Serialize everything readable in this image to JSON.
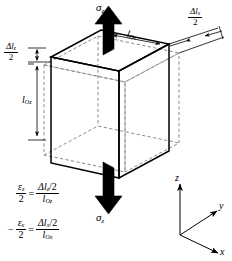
{
  "figure": {
    "background_color": "#ffffff",
    "line_color": "#000000",
    "dashed_color": "#8c8c8c"
  },
  "stress_labels": {
    "top": {
      "symbol": "σ",
      "subscript": "z"
    },
    "bottom": {
      "symbol": "σ",
      "subscript": "z"
    }
  },
  "dimension_labels": {
    "delta_lz_half": {
      "numerator_symbol": "Δl",
      "numerator_sub": "z",
      "denominator": "2"
    },
    "delta_lx_half": {
      "numerator_symbol": "Δl",
      "numerator_sub": "x",
      "denominator": "2"
    },
    "l_oz": {
      "symbol": "l",
      "subscript": "Oz"
    },
    "l_ox": {
      "symbol": "l",
      "subscript": "Ox"
    }
  },
  "equations": [
    {
      "id": "strain-z",
      "lhs": {
        "num_symbol": "ε",
        "num_sub": "z",
        "den": "2"
      },
      "operator": "=",
      "rhs": {
        "num_symbol": "Δl",
        "num_sub": "z",
        "num_tail": "/2",
        "den_symbol": "l",
        "den_sub": "Oz"
      },
      "sign": ""
    },
    {
      "id": "strain-x",
      "lhs": {
        "num_symbol": "ε",
        "num_sub": "x",
        "den": "2"
      },
      "operator": "=",
      "rhs": {
        "num_symbol": "Δl",
        "num_sub": "x",
        "num_tail": "/2",
        "den_symbol": "l",
        "den_sub": "Ox"
      },
      "sign": "−"
    }
  ],
  "axes": {
    "z": "z",
    "y": "y",
    "x": "x"
  }
}
